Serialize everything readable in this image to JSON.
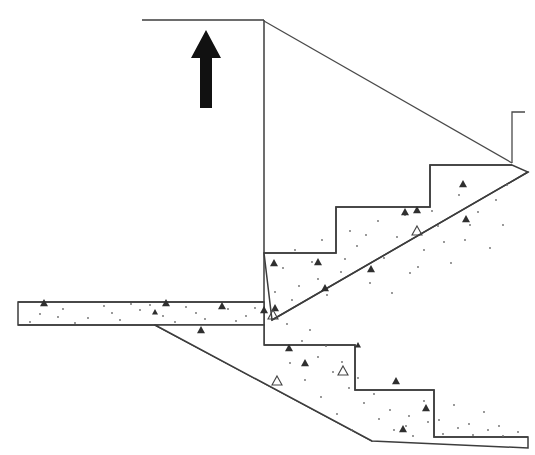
{
  "drawing": {
    "title": "Reinforced Concrete Staircase Section",
    "subject": "stair-section",
    "background_color": "#ffffff",
    "line_color": "#3d3d3d",
    "arrow_color": "#111111",
    "hatch_dot_color": "#6b6b6b",
    "hatch_aggregate_color": "#2f2f2f",
    "width": 535,
    "height": 455
  },
  "annotations": {
    "up_arrow": {
      "icon": "up-arrow-icon",
      "meaning": "direction of ascent",
      "x": 206,
      "y": 30,
      "height": 78
    }
  },
  "geometry": {
    "wall_line": {
      "name": "vertical-wall-line",
      "x": 264,
      "y_top": 20,
      "y_bottom": 345
    },
    "top_floor_line": {
      "name": "upper-floor-line",
      "x_start": 142,
      "x_end": 264,
      "y": 20
    },
    "upper_handrail_diagonal": {
      "name": "upper-guide-diagonal",
      "x1": 264,
      "y1": 21,
      "x2": 512,
      "y2": 163
    },
    "right_stub": {
      "name": "right-vertical-stub",
      "x": 512,
      "y_top": 112,
      "y_bottom": 163,
      "tick_width": 13
    },
    "upper_flight": {
      "name": "upper-stair-flight",
      "direction": "ascending-right",
      "step_count": 3,
      "nosings": [
        {
          "x": 264,
          "y": 253
        },
        {
          "x": 336,
          "y": 253
        },
        {
          "x": 336,
          "y": 207
        },
        {
          "x": 430,
          "y": 207
        },
        {
          "x": 430,
          "y": 165
        },
        {
          "x": 512,
          "y": 165
        }
      ],
      "soffit": {
        "x1": 272,
        "y1": 320,
        "x2": 528,
        "y2": 172
      }
    },
    "lower_flight": {
      "name": "lower-stair-flight",
      "direction": "descending-right",
      "step_count": 3,
      "nosings": [
        {
          "x": 264,
          "y": 345
        },
        {
          "x": 355,
          "y": 345
        },
        {
          "x": 355,
          "y": 390
        },
        {
          "x": 434,
          "y": 390
        },
        {
          "x": 434,
          "y": 437
        },
        {
          "x": 528,
          "y": 437
        }
      ],
      "soffit": {
        "x1": 155,
        "y1": 325,
        "x2": 372,
        "y2": 441
      }
    },
    "landing_slab": {
      "name": "intermediate-landing-slab",
      "top_y": 302,
      "bottom_y": 325,
      "x_left": 18,
      "x_right": 264,
      "bottom_break_x": 155
    }
  },
  "hatching": {
    "pattern_name": "concrete-section-hatch",
    "description": "scattered dots with triangular aggregate marks",
    "dots": [
      [
        40,
        314
      ],
      [
        63,
        309
      ],
      [
        88,
        318
      ],
      [
        104,
        306
      ],
      [
        120,
        320
      ],
      [
        140,
        310
      ],
      [
        163,
        316
      ],
      [
        186,
        307
      ],
      [
        205,
        319
      ],
      [
        228,
        309
      ],
      [
        246,
        316
      ],
      [
        30,
        322
      ],
      [
        75,
        323
      ],
      [
        112,
        313
      ],
      [
        150,
        305
      ],
      [
        196,
        313
      ],
      [
        236,
        321
      ],
      [
        58,
        317
      ],
      [
        131,
        304
      ],
      [
        175,
        322
      ],
      [
        255,
        308
      ],
      [
        283,
        268
      ],
      [
        299,
        286
      ],
      [
        312,
        262
      ],
      [
        327,
        295
      ],
      [
        341,
        272
      ],
      [
        357,
        246
      ],
      [
        370,
        283
      ],
      [
        384,
        258
      ],
      [
        397,
        237
      ],
      [
        410,
        273
      ],
      [
        424,
        250
      ],
      [
        438,
        226
      ],
      [
        451,
        263
      ],
      [
        465,
        240
      ],
      [
        478,
        212
      ],
      [
        490,
        248
      ],
      [
        503,
        225
      ],
      [
        292,
        300
      ],
      [
        318,
        279
      ],
      [
        345,
        259
      ],
      [
        366,
        235
      ],
      [
        392,
        293
      ],
      [
        418,
        267
      ],
      [
        444,
        242
      ],
      [
        470,
        225
      ],
      [
        496,
        200
      ],
      [
        507,
        185
      ],
      [
        459,
        195
      ],
      [
        432,
        211
      ],
      [
        405,
        215
      ],
      [
        378,
        221
      ],
      [
        350,
        231
      ],
      [
        322,
        240
      ],
      [
        295,
        250
      ],
      [
        275,
        292
      ],
      [
        287,
        324
      ],
      [
        302,
        341
      ],
      [
        318,
        357
      ],
      [
        333,
        372
      ],
      [
        349,
        388
      ],
      [
        364,
        403
      ],
      [
        379,
        419
      ],
      [
        394,
        430
      ],
      [
        409,
        416
      ],
      [
        424,
        401
      ],
      [
        439,
        420
      ],
      [
        454,
        405
      ],
      [
        469,
        424
      ],
      [
        484,
        412
      ],
      [
        499,
        426
      ],
      [
        310,
        330
      ],
      [
        326,
        346
      ],
      [
        342,
        362
      ],
      [
        358,
        378
      ],
      [
        374,
        394
      ],
      [
        390,
        410
      ],
      [
        406,
        426
      ],
      [
        290,
        363
      ],
      [
        305,
        380
      ],
      [
        321,
        397
      ],
      [
        337,
        414
      ],
      [
        352,
        430
      ],
      [
        413,
        436
      ],
      [
        428,
        422
      ],
      [
        443,
        434
      ],
      [
        458,
        428
      ],
      [
        473,
        435
      ],
      [
        488,
        430
      ],
      [
        503,
        436
      ],
      [
        518,
        432
      ]
    ],
    "aggregates": [
      {
        "x": 44,
        "y": 303,
        "r": 4,
        "filled": true
      },
      {
        "x": 166,
        "y": 303,
        "r": 4,
        "filled": true
      },
      {
        "x": 222,
        "y": 306,
        "r": 4,
        "filled": true
      },
      {
        "x": 155,
        "y": 312,
        "r": 3,
        "filled": true
      },
      {
        "x": 264,
        "y": 310,
        "r": 4,
        "filled": true
      },
      {
        "x": 275,
        "y": 308,
        "r": 4,
        "filled": true
      },
      {
        "x": 201,
        "y": 330,
        "r": 4,
        "filled": true
      },
      {
        "x": 274,
        "y": 263,
        "r": 4,
        "filled": true
      },
      {
        "x": 318,
        "y": 262,
        "r": 4,
        "filled": true
      },
      {
        "x": 325,
        "y": 288,
        "r": 4,
        "filled": true
      },
      {
        "x": 371,
        "y": 269,
        "r": 4,
        "filled": true
      },
      {
        "x": 405,
        "y": 212,
        "r": 4,
        "filled": true
      },
      {
        "x": 417,
        "y": 210,
        "r": 4,
        "filled": true
      },
      {
        "x": 463,
        "y": 184,
        "r": 4,
        "filled": true
      },
      {
        "x": 466,
        "y": 219,
        "r": 4,
        "filled": true
      },
      {
        "x": 417,
        "y": 231,
        "r": 5,
        "filled": false
      },
      {
        "x": 273,
        "y": 315,
        "r": 5,
        "filled": false
      },
      {
        "x": 305,
        "y": 363,
        "r": 4,
        "filled": true
      },
      {
        "x": 277,
        "y": 381,
        "r": 5,
        "filled": false
      },
      {
        "x": 343,
        "y": 371,
        "r": 5,
        "filled": false
      },
      {
        "x": 289,
        "y": 348,
        "r": 4,
        "filled": true
      },
      {
        "x": 396,
        "y": 381,
        "r": 4,
        "filled": true
      },
      {
        "x": 403,
        "y": 429,
        "r": 4,
        "filled": true
      },
      {
        "x": 426,
        "y": 408,
        "r": 4,
        "filled": true
      },
      {
        "x": 358,
        "y": 345,
        "r": 3,
        "filled": true
      }
    ]
  }
}
